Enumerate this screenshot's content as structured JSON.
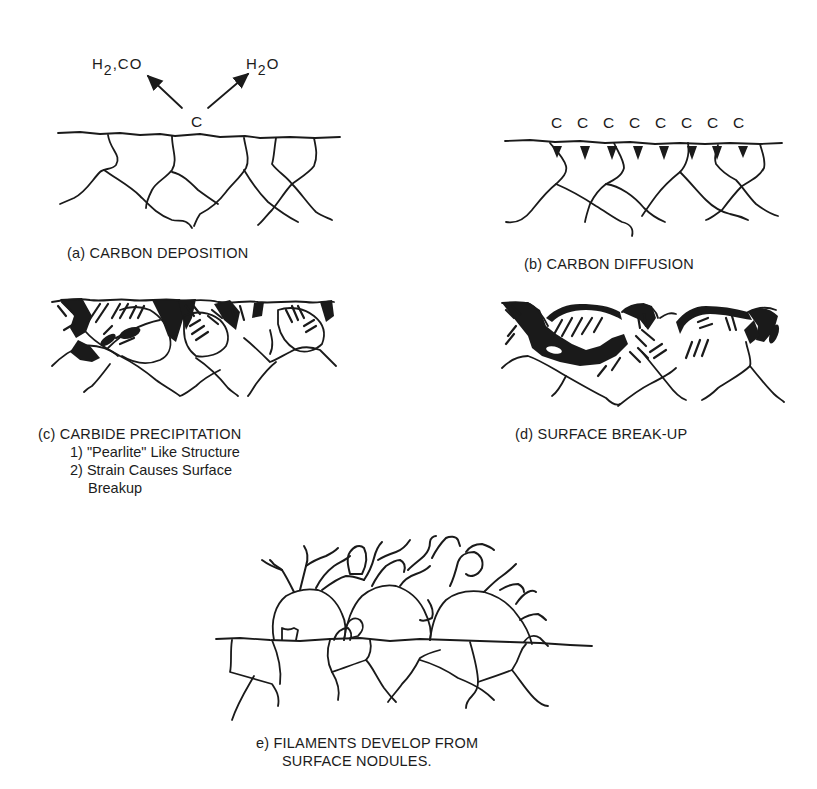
{
  "figure": {
    "panels": [
      {
        "id": "a",
        "caption": "(a) CARBON DEPOSITION",
        "labels": {
          "left_product_main": "H",
          "left_product_sub": "2",
          "left_product_rest": ",CO",
          "right_product_main": "H",
          "right_product_sub": "2",
          "right_product_rest": "O",
          "center_atom": "C"
        }
      },
      {
        "id": "b",
        "caption": "(b) CARBON DIFFUSION",
        "carbon_atoms": [
          "C",
          "C",
          "C",
          "C",
          "C",
          "C",
          "C",
          "C"
        ]
      },
      {
        "id": "c",
        "caption": "(c) CARBIDE PRECIPITATION",
        "notes": [
          "1) \"Pearlite\" Like Structure",
          "2) Strain Causes Surface",
          "Breakup"
        ]
      },
      {
        "id": "d",
        "caption": "(d) SURFACE BREAK-UP"
      },
      {
        "id": "e",
        "caption_line1": "e) FILAMENTS DEVELOP FROM",
        "caption_line2": "SURFACE NODULES."
      }
    ]
  },
  "colors": {
    "ink": "#1a1a1a",
    "background": "#ffffff"
  }
}
